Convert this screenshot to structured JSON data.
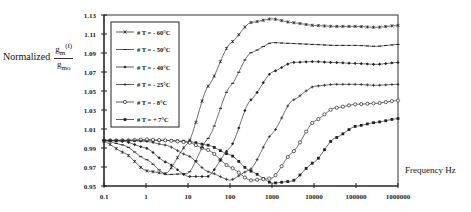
{
  "labels": {
    "y_prefix": "Normalized",
    "y_num": "g",
    "y_num_sub": "m",
    "y_num_suffix": "(f)",
    "y_den": "g",
    "y_den_sub": "mo",
    "x_label": "Frequency Hz"
  },
  "chart_data": {
    "type": "line",
    "title": "",
    "xlabel": "Frequency Hz",
    "ylabel": "Normalized gm(f)/gmo",
    "xscale": "log",
    "xlim": [
      0.1,
      1000000
    ],
    "ylim": [
      0.95,
      1.13
    ],
    "x_ticks": [
      "0.1",
      "1",
      "10",
      "100",
      "1000",
      "10000",
      "100000",
      "1000000"
    ],
    "y_ticks": [
      "0.95",
      "0.97",
      "0.99",
      "1.01",
      "1.03",
      "1.05",
      "1.07",
      "1.09",
      "1.11",
      "1.13"
    ],
    "grid": false,
    "legend_position": "upper-left-inside",
    "x": [
      0.1,
      0.3,
      1,
      3,
      10,
      30,
      100,
      300,
      1000,
      3000,
      10000,
      30000,
      100000,
      300000,
      1000000
    ],
    "series": [
      {
        "name": "# T = + 7°C",
        "marker": "filled-square",
        "values": [
          0.998,
          0.998,
          0.998,
          0.998,
          0.997,
          0.993,
          0.983,
          0.966,
          0.953,
          0.955,
          0.975,
          1.0,
          1.013,
          1.017,
          1.021
        ]
      },
      {
        "name": "# T = - 8°C",
        "marker": "open-circle",
        "values": [
          0.998,
          0.998,
          0.999,
          0.998,
          0.996,
          0.988,
          0.97,
          0.956,
          0.958,
          0.985,
          1.018,
          1.032,
          1.036,
          1.037,
          1.04
        ]
      },
      {
        "name": "# T = - 25°C",
        "marker": "plus",
        "values": [
          0.998,
          0.998,
          0.997,
          0.993,
          0.982,
          0.965,
          0.956,
          0.967,
          1.005,
          1.04,
          1.055,
          1.057,
          1.057,
          1.056,
          1.057
        ]
      },
      {
        "name": "# T = - 40°C",
        "marker": "filled-diamond",
        "values": [
          0.998,
          0.997,
          0.99,
          0.975,
          0.96,
          0.96,
          0.99,
          1.04,
          1.07,
          1.08,
          1.081,
          1.08,
          1.079,
          1.078,
          1.08
        ]
      },
      {
        "name": "# T = - 50°C",
        "marker": "dash",
        "values": [
          0.998,
          0.993,
          0.978,
          0.962,
          0.963,
          1.0,
          1.055,
          1.09,
          1.101,
          1.1,
          1.099,
          1.098,
          1.098,
          1.097,
          1.099
        ]
      },
      {
        "name": "# T = - 60°C",
        "marker": "star",
        "values": [
          0.997,
          0.985,
          0.966,
          0.963,
          0.995,
          1.055,
          1.1,
          1.122,
          1.126,
          1.122,
          1.119,
          1.118,
          1.118,
          1.117,
          1.119
        ]
      }
    ]
  }
}
